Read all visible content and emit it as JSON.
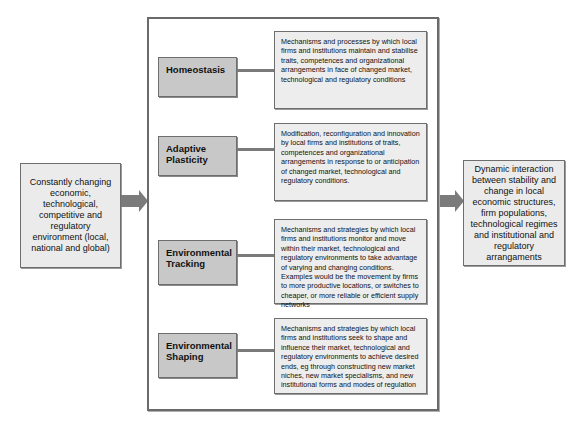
{
  "input": {
    "text": "Constantly changing economic, technological, competitive and regulatory environment (local, national and global)"
  },
  "output": {
    "text": "Dynamic interaction between stability and change in local economic structures, firm populations, technological regimes and institutional and regulatory arrangaments"
  },
  "mechanisms": [
    {
      "label": "Homeostasis",
      "description": "Mechanisms  and processes by which local firms and institutions maintain and stabilise traits, competences and organizational arrangements in face of changed market, technological and regulatory conditions"
    },
    {
      "label": "Adaptive Plasticity",
      "description": "Modification, reconfiguration and innovation by local firms and institutions of traits, competences and organizational arrangements in response to or anticipation of changed market, technological and regulatory conditions."
    },
    {
      "label": "Environmental Tracking",
      "description": "Mechanisms and strategies by which local firms and institutions monitor and move within their market, technological and regulatory environments to take advantage of varying and changing conditions. Examples would be the movement by firms to more productive locations, or switches to cheaper, or more reliable or efficient supply networks"
    },
    {
      "label": "Environmental Shaping",
      "description": "Mechanisms and strategies by which local firms and institutions seek to shape and influence their market, technological and regulatory environments to achieve desired ends, eg through constructing new market niches, new market specialisms, and new institutional forms and modes of regulation"
    }
  ],
  "colors": {
    "label_fill": "#c8c8c8",
    "desc_fill": "#ededed",
    "side_fill": "#ebebeb",
    "arrow": "#7b7b7b",
    "border": "#6e6e6e"
  }
}
